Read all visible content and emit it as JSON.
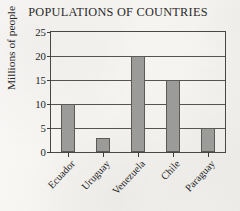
{
  "chart_data": {
    "type": "bar",
    "title": "POPULATIONS OF COUNTRIES",
    "xlabel": "",
    "ylabel": "Millions of people",
    "categories": [
      "Ecuador",
      "Uruguay",
      "Venezuela",
      "Chile",
      "Paraguay"
    ],
    "values": [
      10,
      3,
      20,
      15,
      5
    ],
    "ylim": [
      0,
      25
    ],
    "yticks": [
      0,
      5,
      10,
      15,
      20,
      25
    ],
    "ytick_labels": [
      "0",
      "5",
      "10",
      "15",
      "20",
      "25"
    ],
    "grid": "horizontal",
    "legend": "none",
    "bar_color": "#9b9b99",
    "bar_edge_color": "#5c5a57",
    "axis_color": "#4a4845",
    "background_color": "#f6f5f3",
    "xtick_label_rotation": -47
  }
}
